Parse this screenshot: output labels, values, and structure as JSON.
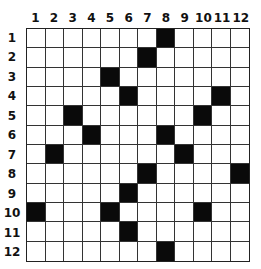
{
  "puzzle": {
    "rows": 12,
    "cols": 12,
    "column_labels": [
      "1",
      "2",
      "3",
      "4",
      "5",
      "6",
      "7",
      "8",
      "9",
      "10",
      "11",
      "12"
    ],
    "row_labels": [
      "1",
      "2",
      "3",
      "4",
      "5",
      "6",
      "7",
      "8",
      "9",
      "10",
      "11",
      "12"
    ],
    "black_cells": [
      [
        1,
        8
      ],
      [
        2,
        7
      ],
      [
        3,
        5
      ],
      [
        4,
        6
      ],
      [
        4,
        11
      ],
      [
        5,
        3
      ],
      [
        5,
        10
      ],
      [
        6,
        4
      ],
      [
        6,
        8
      ],
      [
        7,
        2
      ],
      [
        7,
        9
      ],
      [
        8,
        7
      ],
      [
        8,
        12
      ],
      [
        9,
        6
      ],
      [
        10,
        1
      ],
      [
        10,
        5
      ],
      [
        10,
        10
      ],
      [
        11,
        6
      ],
      [
        12,
        8
      ]
    ],
    "colors": {
      "filled": "#0a0a0a",
      "empty": "#ffffff",
      "line": "#333333"
    }
  }
}
